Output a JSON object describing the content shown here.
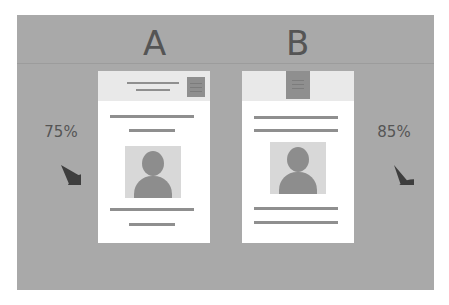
{
  "colors": {
    "panel_bg": "#a9a9a9",
    "card_bg": "#ffffff",
    "header_bg": "#e9e9e9",
    "accent_gray": "#8f8f8f",
    "pie_fill": "#3e3e3e",
    "label_text": "#555555"
  },
  "variants": [
    {
      "label": "A",
      "stat": "75%",
      "percent": 75,
      "header_layout": "title-left-button-right",
      "body_layout": "lines-photo-lines"
    },
    {
      "label": "B",
      "stat": "85%",
      "percent": 85,
      "header_layout": "button-center",
      "body_layout": "lines-photo-lines"
    }
  ],
  "icons": {
    "profile_photo": "person-silhouette-icon",
    "header_button": "menu-button-icon",
    "stat_chart": "pie-chart-icon"
  }
}
